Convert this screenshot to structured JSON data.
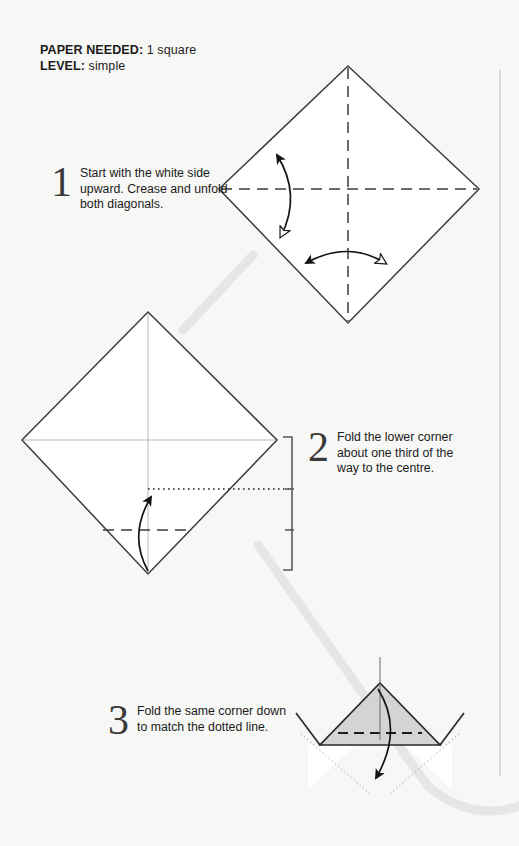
{
  "document": {
    "type": "origami-instruction-diagram",
    "background_color": "#f7f7f5",
    "ink_color": "#1c1c1c",
    "shade_color": "#d4d4d4",
    "connector_color": "#e3e3e1"
  },
  "header": {
    "paper_label": "PAPER NEEDED:",
    "paper_value": " 1 square",
    "level_label": "LEVEL:",
    "level_value": " simple"
  },
  "steps": [
    {
      "number": "1",
      "text": "Start with the white side upward. Crease and unfold both diagonals."
    },
    {
      "number": "2",
      "text": "Fold the lower corner about one third of the way to the centre."
    },
    {
      "number": "3",
      "text": "Fold the same corner down to match the dotted line."
    }
  ],
  "diagrams": [
    {
      "id": "diagram-1",
      "caption_step": "1",
      "shape": "square rotated 45 degrees (diamond), white side up",
      "creases": [
        "vertical dashed diagonal",
        "horizontal dashed diagonal"
      ],
      "arrows": [
        "curved double arrow on left edge, solid head up / hollow head down",
        "curved double arrow at lower centre, solid head left / hollow head right"
      ]
    },
    {
      "id": "diagram-2",
      "caption_step": "2",
      "shape": "diamond with faint creases",
      "guide_lines": [
        "dotted target line at one third",
        "dashed fold line below"
      ],
      "arrows": [
        "curved solid arrow pointing up from bottom corner"
      ],
      "measure_bracket": "right-side bracket divided showing one third"
    },
    {
      "id": "diagram-3",
      "caption_step": "3",
      "shape": "shaded triangle flap with white side wings",
      "guide_lines": [
        "dashed fold line across triangle",
        "dotted outline of previous position"
      ],
      "arrows": [
        "curved solid arrow pointing down"
      ]
    }
  ]
}
